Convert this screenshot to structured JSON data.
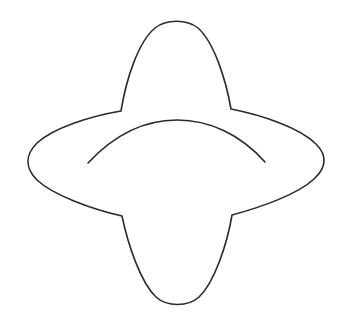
{
  "figure": {
    "background_color": "#ffffff",
    "stroke_color": "#2a2a2a",
    "elements": [
      {
        "name": "outer-contour",
        "kind": "closed-outline",
        "parts": [
          "top-lobe",
          "right-lobe",
          "bottom-lobe",
          "left-lobe"
        ]
      },
      {
        "name": "inner-arc",
        "kind": "open-arc",
        "orientation": "concave-down"
      }
    ]
  }
}
